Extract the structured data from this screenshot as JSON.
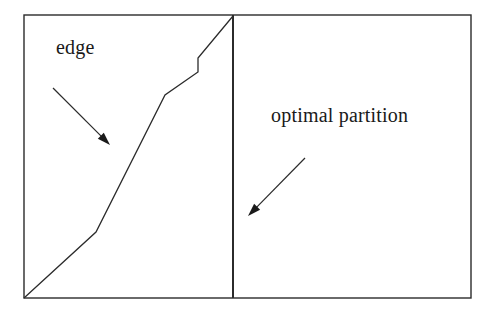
{
  "figure": {
    "background_color": "#ffffff",
    "stroke_color": "#2b2b2b",
    "text_color": "#1a1a1a",
    "width": 496,
    "height": 317
  },
  "labels": {
    "edge": "edge",
    "optimal_partition": "optimal partition"
  },
  "chart_data": {
    "type": "line",
    "xlabel": "",
    "ylabel": "",
    "xlim": [
      24,
      471
    ],
    "ylim": [
      298,
      15
    ],
    "grid": false,
    "legend_position": "none",
    "frame": {
      "name": "outer-rectangle",
      "x": 24,
      "y": 15,
      "width": 447,
      "height": 283,
      "stroke": "#2b2b2b",
      "stroke_width": 1.4,
      "fill": "none"
    },
    "series": [
      {
        "name": "optimal partition",
        "type": "segment",
        "stroke": "#2b2b2b",
        "stroke_width": 2,
        "points": [
          [
            233,
            15
          ],
          [
            233,
            298
          ]
        ]
      },
      {
        "name": "edge",
        "type": "polyline",
        "stroke": "#2b2b2b",
        "stroke_width": 1.3,
        "points": [
          [
            24,
            298
          ],
          [
            96,
            232
          ],
          [
            165,
            95
          ],
          [
            198,
            72
          ],
          [
            198,
            58
          ],
          [
            233,
            16
          ]
        ]
      }
    ],
    "annotations": [
      {
        "name": "edge",
        "text": "edge",
        "text_x": 56,
        "text_y": 53,
        "font_size": 20,
        "arrow": {
          "from": [
            53,
            88
          ],
          "to": [
            110,
            145
          ],
          "stroke": "#2b2b2b",
          "stroke_width": 1.2,
          "head": "filled"
        }
      },
      {
        "name": "optimal partition",
        "text": "optimal partition",
        "text_x": 271,
        "text_y": 121,
        "font_size": 20,
        "arrow": {
          "from": [
            305,
            158
          ],
          "to": [
            248,
            216
          ],
          "stroke": "#2b2b2b",
          "stroke_width": 1.2,
          "head": "filled"
        }
      }
    ]
  }
}
